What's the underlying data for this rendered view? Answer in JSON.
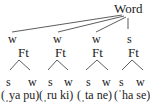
{
  "root": {
    "label": "Word"
  },
  "feet": [
    {
      "weight": "w",
      "label": "Ft",
      "children": [
        "s",
        "w"
      ],
      "syllables": "(ˌya pu)"
    },
    {
      "weight": "w",
      "label": "Ft",
      "children": [
        "s",
        "w"
      ],
      "syllables": "(ˌru ki)"
    },
    {
      "weight": "w",
      "label": "Ft",
      "children": [
        "s",
        "w"
      ],
      "syllables": "(ˌta ne)"
    },
    {
      "weight": "s",
      "label": "Ft",
      "children": [
        "s",
        "w"
      ],
      "syllables": "(ˈha se)"
    }
  ],
  "colors": {
    "ink": "#222222",
    "background": "#ffffff"
  }
}
